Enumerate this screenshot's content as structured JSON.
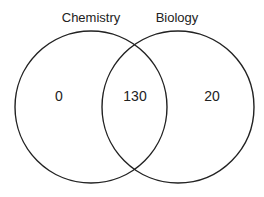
{
  "diagram": {
    "type": "venn",
    "sets": [
      {
        "name": "Chemistry",
        "only_value": "0"
      },
      {
        "name": "Biology",
        "only_value": "20"
      }
    ],
    "intersection_value": "130",
    "stroke_color": "#222222"
  }
}
